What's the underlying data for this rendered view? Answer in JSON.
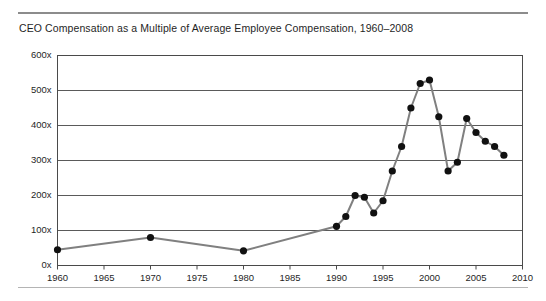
{
  "chart_data": {
    "type": "line",
    "title": "CEO Compensation as a Multiple of Average Employee Compensation, 1960–2008",
    "xlabel": "",
    "ylabel": "",
    "xlim": [
      1960,
      2010
    ],
    "ylim": [
      0,
      600
    ],
    "grid": true,
    "legend": null,
    "yticks": [
      0,
      100,
      200,
      300,
      400,
      500,
      600
    ],
    "ytick_labels": [
      "0x",
      "100x",
      "200x",
      "300x",
      "400x",
      "500x",
      "600x"
    ],
    "xticks": [
      1960,
      1965,
      1970,
      1975,
      1980,
      1985,
      1990,
      1995,
      2000,
      2005,
      2010
    ],
    "xtick_labels": [
      "1960",
      "1965",
      "1970",
      "1975",
      "1980",
      "1985",
      "1990",
      "1995",
      "2000",
      "2005",
      "2010"
    ],
    "series": [
      {
        "name": "CEO compensation multiple",
        "color": "#808080",
        "marker_color": "#111111",
        "x": [
          1960,
          1970,
          1980,
          1990,
          1991,
          1992,
          1993,
          1994,
          1995,
          1996,
          1997,
          1998,
          1999,
          2000,
          2001,
          2002,
          2003,
          2004,
          2005,
          2006,
          2007,
          2008
        ],
        "values": [
          45,
          80,
          42,
          112,
          140,
          200,
          195,
          150,
          185,
          270,
          340,
          450,
          520,
          530,
          425,
          270,
          295,
          420,
          380,
          355,
          340,
          315
        ]
      }
    ]
  },
  "axis": {
    "y_unit_suffix": "x",
    "x_start_label": "1960",
    "x_end_label": "2010"
  },
  "colors": {
    "line": "#808080",
    "marker": "#111111",
    "gridline": "#5a5a5a",
    "frame": "#4a4a4a",
    "rule_top": "#8c8c8c",
    "rule_bottom": "#b4b4b4",
    "background": "#ffffff",
    "text": "#1f1f1f"
  }
}
